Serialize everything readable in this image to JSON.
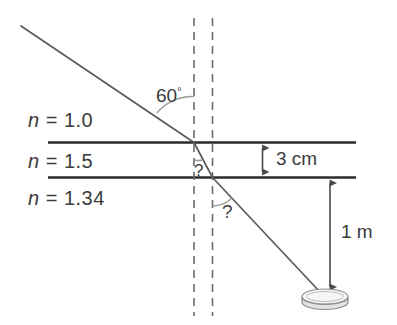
{
  "diagram": {
    "media": [
      {
        "id": "air",
        "label_prefix": "n",
        "label_eq": " = ",
        "label_value": "1.0",
        "full": "n = 1.0"
      },
      {
        "id": "glass",
        "label_prefix": "n",
        "label_eq": " = ",
        "label_value": "1.5",
        "full": "n = 1.5"
      },
      {
        "id": "water",
        "label_prefix": "n",
        "label_eq": " = ",
        "label_value": "1.34",
        "full": "n = 1.34"
      }
    ],
    "angles": [
      {
        "id": "incident",
        "value": "60",
        "degree_symbol": "°",
        "full": "60°"
      },
      {
        "id": "refracted-in-glass",
        "value": "?",
        "full": "?"
      },
      {
        "id": "refracted-in-water",
        "value": "?",
        "full": "?"
      }
    ],
    "dimensions": [
      {
        "id": "glass-thickness",
        "full": "3 cm",
        "value": "3",
        "unit": "cm"
      },
      {
        "id": "water-depth",
        "full": "1 m",
        "value": "1",
        "unit": "m"
      }
    ],
    "objects": [
      {
        "id": "coin",
        "name": "coin"
      }
    ],
    "colors": {
      "boundary_line": "#2b2b2b",
      "ray_line": "#555555",
      "dashed_normal": "#6b6b6b",
      "arc": "#8a8a8a",
      "dimension_arrow": "#4a4a4a",
      "text": "#3b3b3b",
      "coin_fill": "#f2f2f2",
      "coin_stroke": "#8e8e8e",
      "background": "#ffffff"
    }
  }
}
